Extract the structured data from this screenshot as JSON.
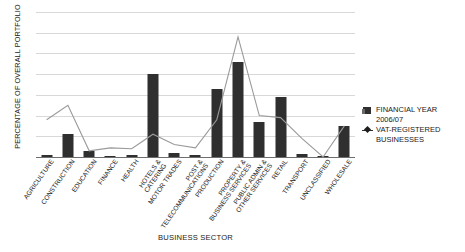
{
  "chart_data": {
    "type": "bar",
    "title": "",
    "xlabel": "BUSINESS SECTOR",
    "ylabel": "PERCENTAGE OF OVERALL PORTFOLIO",
    "ylim": [
      0,
      35
    ],
    "yticks": [
      "35.00",
      "30.00",
      "25.00",
      "20.00",
      "15.00",
      "10.00",
      "5.00",
      "0.00"
    ],
    "ytick_values": [
      35,
      30,
      25,
      20,
      15,
      10,
      5,
      0
    ],
    "grid": true,
    "legend_position": "right",
    "categories": [
      "AGRICULTURE",
      "CONSTRUCTION",
      "EDUCATION",
      "FINANCE",
      "HEALTH",
      "HOTELS & CATERING",
      "MOTOR TRADES",
      "POST & TELECOMMUNICATIONS",
      "PRODUCTION",
      "PROPERTY & BUSINESS SERVICES",
      "PUBLIC ADMIN & OTHER SERVICES",
      "RETAIL",
      "TRANSPORT",
      "UNCLASSIFIED",
      "WHOLESALE"
    ],
    "series": [
      {
        "name": "FINANCIAL YEAR 2006/07",
        "type": "bar",
        "color": "#2f2f2f",
        "values": [
          0.6,
          5.6,
          1.4,
          0.3,
          0.4,
          20.0,
          1.0,
          0.5,
          16.5,
          23.0,
          8.5,
          14.5,
          0.8,
          0.2,
          7.5
        ]
      },
      {
        "name": "VAT-REGISTERED BUSINESSES",
        "type": "line",
        "color": "#9a9a9a",
        "values": [
          9.0,
          12.5,
          1.5,
          2.2,
          2.0,
          5.5,
          3.0,
          2.2,
          9.0,
          29.0,
          10.0,
          9.5,
          4.5,
          0.0,
          7.5
        ]
      }
    ],
    "legend": [
      {
        "label_line1": "FINANCIAL YEAR",
        "label_line2": "2006/07",
        "marker": "square-marker"
      },
      {
        "label_line1": "VAT-REGISTERED",
        "label_line2": "BUSINESSES",
        "marker": "diamond-line-marker"
      }
    ]
  }
}
